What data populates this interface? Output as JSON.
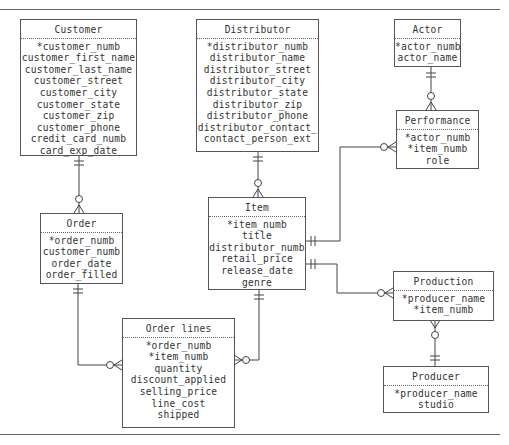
{
  "diagram": {
    "type": "entity-relationship",
    "notation": "crow's foot",
    "entities": [
      {
        "id": "customer",
        "name": "Customer",
        "attributes": [
          "*customer_numb",
          "customer_first_name",
          "customer_last_name",
          "customer_street",
          "customer_city",
          "customer_state",
          "customer_zip",
          "customer_phone",
          "credit_card_numb",
          "card_exp_date"
        ]
      },
      {
        "id": "distributor",
        "name": "Distributor",
        "attributes": [
          "*distributor_numb",
          "distributor_name",
          "distributor_street",
          "distributor_city",
          "distributor_state",
          "distributor_zip",
          "distributor_phone",
          "distributor_contact_",
          "contact_person_ext"
        ]
      },
      {
        "id": "actor",
        "name": "Actor",
        "attributes": [
          "*actor_numb",
          "actor_name"
        ]
      },
      {
        "id": "performance",
        "name": "Performance",
        "attributes": [
          "*actor_numb",
          "*item_numb",
          "role"
        ]
      },
      {
        "id": "order",
        "name": "Order",
        "attributes": [
          "*order_numb",
          "customer_numb",
          "order_date",
          "order_filled"
        ]
      },
      {
        "id": "item",
        "name": "Item",
        "attributes": [
          "*item_numb",
          "title",
          "distributor_numb",
          "retail_price",
          "release_date",
          "genre"
        ]
      },
      {
        "id": "order_lines",
        "name": "Order lines",
        "attributes": [
          "*order_numb",
          "*item_numb",
          "quantity",
          "discount_applied",
          "selling_price",
          "line_cost",
          "shipped"
        ]
      },
      {
        "id": "production",
        "name": "Production",
        "attributes": [
          "*producer_name",
          "*item_numb"
        ]
      },
      {
        "id": "producer",
        "name": "Producer",
        "attributes": [
          "*producer_name",
          "studio"
        ]
      }
    ],
    "relationships": [
      {
        "from": "Customer",
        "to": "Order",
        "from_card": "one-and-only-one",
        "to_card": "zero-or-many"
      },
      {
        "from": "Distributor",
        "to": "Item",
        "from_card": "one-and-only-one",
        "to_card": "zero-or-many"
      },
      {
        "from": "Actor",
        "to": "Performance",
        "from_card": "one-and-only-one",
        "to_card": "zero-or-many"
      },
      {
        "from": "Item",
        "to": "Performance",
        "from_card": "one-and-only-one",
        "to_card": "zero-or-many"
      },
      {
        "from": "Item",
        "to": "Production",
        "from_card": "one-and-only-one",
        "to_card": "zero-or-many"
      },
      {
        "from": "Producer",
        "to": "Production",
        "from_card": "one-and-only-one",
        "to_card": "zero-or-many"
      },
      {
        "from": "Order",
        "to": "Order lines",
        "from_card": "one-and-only-one",
        "to_card": "zero-or-many"
      },
      {
        "from": "Item",
        "to": "Order lines",
        "from_card": "one-and-only-one",
        "to_card": "zero-or-many"
      }
    ]
  }
}
